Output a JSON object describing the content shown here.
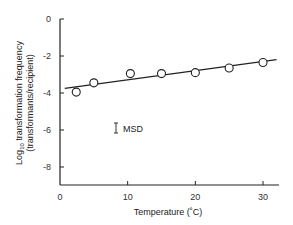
{
  "chart_data": {
    "type": "scatter",
    "title": "",
    "xlabel": "Temperature (˚C)",
    "ylabel_line1": "Log10 transformation frequency",
    "ylabel_line2": "(transformants/recipient)",
    "xlim": [
      0,
      32
    ],
    "ylim": [
      -9,
      0
    ],
    "x_ticks": [
      0,
      10,
      20,
      30
    ],
    "y_ticks": [
      0,
      -2,
      -4,
      -6,
      -8
    ],
    "grid": false,
    "series": [
      {
        "name": "observed",
        "marker": "open-circle",
        "points": [
          {
            "x": 2.4,
            "y": -3.95
          },
          {
            "x": 5,
            "y": -3.45
          },
          {
            "x": 10.4,
            "y": -2.95
          },
          {
            "x": 15,
            "y": -2.95
          },
          {
            "x": 20,
            "y": -2.9
          },
          {
            "x": 25,
            "y": -2.65
          },
          {
            "x": 30,
            "y": -2.35
          }
        ]
      },
      {
        "name": "regression line",
        "type": "line",
        "points": [
          {
            "x": 0.7,
            "y": -3.75
          },
          {
            "x": 32,
            "y": -2.2
          }
        ]
      }
    ],
    "annotations": [
      {
        "text": "MSD",
        "marker": "error-bar",
        "x": 8,
        "y": -5.1
      }
    ]
  },
  "labels": {
    "x_axis": "Temperature (˚C)",
    "y_axis_prefix": "Log",
    "y_axis_sub": "10",
    "y_axis_rest": " transformation frequency",
    "y_axis_line2": "(transformants/recipient)",
    "msd": "MSD",
    "x_ticks": [
      "0",
      "10",
      "20",
      "30"
    ],
    "y_ticks": [
      "0",
      "-2",
      "-4",
      "-6",
      "-8"
    ]
  }
}
